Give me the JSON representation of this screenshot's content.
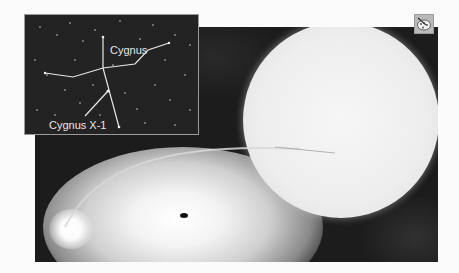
{
  "figure": {
    "inset": {
      "constellation_label": "Cygnus",
      "object_label": "Cygnus X-1"
    },
    "main": {
      "elements": [
        "supergiant-star",
        "accretion-disk",
        "black-hole",
        "gas-stream",
        "hot-spot"
      ]
    },
    "colors": {
      "background": "#fbfbfb",
      "space": "#1c1c1c",
      "inset_bg": "#232323",
      "lines": "#e8e8e8"
    }
  },
  "toolbar": {
    "palette_icon": "palette-icon"
  }
}
